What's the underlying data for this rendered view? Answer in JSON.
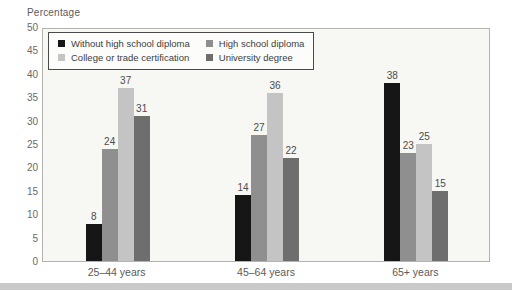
{
  "page": {
    "bottom_band_color": "#c9c9c9"
  },
  "chart_data": {
    "type": "bar",
    "title": "",
    "ylabel": "Percentage",
    "xlabel": "",
    "categories": [
      "25–44 years",
      "45–64 years",
      "65+ years"
    ],
    "series": [
      {
        "name": "Without high school diploma",
        "color": "#161616",
        "values": [
          8,
          14,
          38
        ]
      },
      {
        "name": "High school diploma",
        "color": "#8f8f8f",
        "values": [
          24,
          27,
          23
        ]
      },
      {
        "name": "College or trade certification",
        "color": "#c4c4c4",
        "values": [
          37,
          36,
          25
        ]
      },
      {
        "name": "University degree",
        "color": "#6e6e6e",
        "values": [
          31,
          22,
          15
        ]
      }
    ],
    "ylim": [
      0,
      50
    ],
    "yticks": [
      0,
      5,
      10,
      15,
      20,
      25,
      30,
      35,
      40,
      45,
      50
    ],
    "grid": false,
    "bar_labels": true,
    "legend_position": "inside-top-left",
    "plot_background": "#f7f7f4",
    "axis_color": "#b3b3b0"
  }
}
